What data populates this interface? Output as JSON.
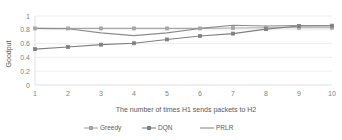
{
  "chart_data": {
    "type": "line",
    "title": "",
    "xlabel": "The number of times H1 sends packets to H2",
    "ylabel": "Goodput",
    "x": [
      1,
      2,
      3,
      4,
      5,
      6,
      7,
      8,
      9,
      10
    ],
    "xticklabels": [
      "1",
      "2",
      "3",
      "4",
      "5",
      "6",
      "7",
      "8",
      "9",
      "10"
    ],
    "yticklabels": [
      "0",
      "0.2",
      "0.4",
      "0.6",
      "0.8",
      "1"
    ],
    "ytickvalues": [
      0,
      0.2,
      0.4,
      0.6,
      0.8,
      1
    ],
    "ylim": [
      0,
      1
    ],
    "xlim": [
      1,
      10
    ],
    "grid": true,
    "legend_position": "bottom",
    "series": [
      {
        "name": "Greedy",
        "color": "#a6a6a6",
        "marker": "square",
        "values": [
          0.82,
          0.82,
          0.82,
          0.82,
          0.82,
          0.82,
          0.825,
          0.83,
          0.83,
          0.83
        ]
      },
      {
        "name": "DQN",
        "color": "#808080",
        "marker": "square",
        "values": [
          0.52,
          0.55,
          0.585,
          0.605,
          0.66,
          0.71,
          0.745,
          0.81,
          0.855,
          0.86
        ]
      },
      {
        "name": "PRLR",
        "color": "#8c8c8c",
        "marker": "none",
        "values": [
          0.82,
          0.815,
          0.755,
          0.715,
          0.755,
          0.82,
          0.865,
          0.855,
          0.86,
          0.86
        ]
      }
    ]
  },
  "legend": {
    "items": [
      {
        "label": "Greedy"
      },
      {
        "label": "DQN"
      },
      {
        "label": "PRLR"
      }
    ]
  },
  "colors": {
    "greedy": "#a6a6a6",
    "dqn": "#808080",
    "prlr": "#8c8c8c",
    "grid": "#e8e8e8",
    "text": "#7f7f7f",
    "background": "#ffffff"
  }
}
